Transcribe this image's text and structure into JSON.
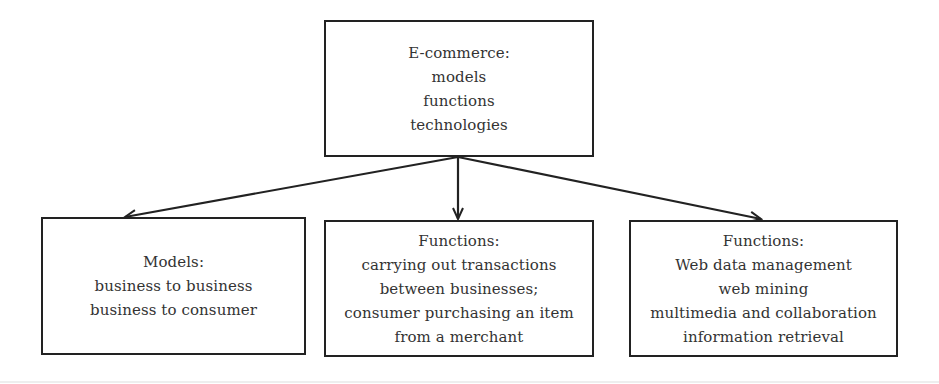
{
  "diagram": {
    "root": {
      "title": "E-commerce:",
      "lines": [
        "models",
        "functions",
        "technologies"
      ]
    },
    "children": [
      {
        "id": "models",
        "title": "Models:",
        "lines": [
          "business to business",
          "business to consumer"
        ]
      },
      {
        "id": "functions-transactions",
        "title": "Functions:",
        "lines": [
          "carrying out transactions",
          "between businesses;",
          "consumer purchasing an item",
          "from a merchant"
        ]
      },
      {
        "id": "functions-web",
        "title": "Functions:",
        "lines": [
          "Web data management",
          "web mining",
          "multimedia and collaboration",
          "information retrieval"
        ]
      }
    ],
    "colors": {
      "border": "#222222",
      "text": "#333333",
      "arrow": "#222222"
    }
  }
}
